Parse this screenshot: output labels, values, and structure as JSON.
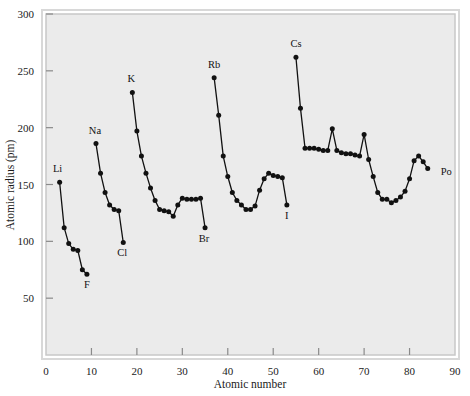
{
  "chart_data": {
    "type": "line",
    "title": "",
    "xlabel": "Atomic number",
    "ylabel": "Atomic radius (pm)",
    "xlim": [
      0,
      90
    ],
    "ylim": [
      0,
      300
    ],
    "xticks": [
      0,
      10,
      20,
      30,
      40,
      50,
      60,
      70,
      80,
      90
    ],
    "yticks": [
      0,
      50,
      100,
      150,
      200,
      250,
      300
    ],
    "grid": false,
    "legend": null,
    "marker": "filled-circle",
    "line_color": "#111111",
    "plot_background": "#ebebeb",
    "frame_color": "#c8c8c8",
    "series": [
      {
        "name": "period-2",
        "x": [
          3,
          4,
          5,
          6,
          7,
          8,
          9
        ],
        "values": [
          152,
          112,
          98,
          93,
          92,
          75,
          71
        ]
      },
      {
        "name": "period-3",
        "x": [
          11,
          12,
          13,
          14,
          15,
          16,
          17
        ],
        "values": [
          186,
          160,
          143,
          132,
          128,
          127,
          99
        ]
      },
      {
        "name": "period-4",
        "x": [
          19,
          20,
          21,
          22,
          23,
          24,
          25,
          26,
          27,
          28,
          29,
          30,
          31,
          32,
          33,
          34,
          35
        ],
        "values": [
          231,
          197,
          175,
          160,
          147,
          136,
          128,
          127,
          126,
          122,
          132,
          138,
          137,
          137,
          137,
          138,
          112
        ]
      },
      {
        "name": "period-5",
        "x": [
          37,
          38,
          39,
          40,
          41,
          42,
          43,
          44,
          45,
          46,
          47,
          48,
          49,
          50,
          51,
          52,
          53
        ],
        "values": [
          244,
          211,
          175,
          157,
          143,
          136,
          132,
          128,
          128,
          131,
          145,
          155,
          160,
          158,
          157,
          156,
          132
        ]
      },
      {
        "name": "period-6",
        "x": [
          55,
          56,
          57,
          58,
          59,
          60,
          61,
          62,
          63,
          64,
          65,
          66,
          67,
          68,
          69,
          70,
          71,
          72,
          73,
          74,
          75,
          76,
          77,
          78,
          79,
          80,
          81,
          82,
          83,
          84
        ],
        "values": [
          262,
          217,
          182,
          182,
          182,
          181,
          180,
          180,
          199,
          180,
          178,
          177,
          177,
          176,
          175,
          194,
          172,
          157,
          143,
          137,
          137,
          134,
          136,
          139,
          144,
          155,
          171,
          175,
          170,
          164
        ]
      }
    ],
    "point_labels": [
      {
        "text": "Li",
        "x": 3,
        "y": 152,
        "dx": -2,
        "dy": -10
      },
      {
        "text": "F",
        "x": 9,
        "y": 71,
        "dx": 0,
        "dy": 14
      },
      {
        "text": "Na",
        "x": 11,
        "y": 186,
        "dx": -1,
        "dy": -10
      },
      {
        "text": "Cl",
        "x": 17,
        "y": 99,
        "dx": -1,
        "dy": 14
      },
      {
        "text": "K",
        "x": 19,
        "y": 231,
        "dx": -1,
        "dy": -10
      },
      {
        "text": "Br",
        "x": 35,
        "y": 112,
        "dx": -1,
        "dy": 14
      },
      {
        "text": "Rb",
        "x": 37,
        "y": 244,
        "dx": 0,
        "dy": -10
      },
      {
        "text": "I",
        "x": 53,
        "y": 132,
        "dx": 0,
        "dy": 14
      },
      {
        "text": "Cs",
        "x": 55,
        "y": 262,
        "dx": 0,
        "dy": -10
      },
      {
        "text": "Po",
        "x": 84,
        "y": 164,
        "dx": 13,
        "dy": 6
      }
    ]
  }
}
